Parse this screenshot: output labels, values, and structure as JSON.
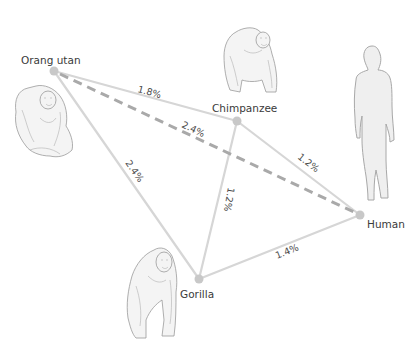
{
  "diagram": {
    "type": "genetic-distance-network",
    "nodes": [
      {
        "id": "orangutan",
        "label": "Orang utan",
        "illustration": "orangutan-icon"
      },
      {
        "id": "chimpanzee",
        "label": "Chimpanzee",
        "illustration": "chimpanzee-icon"
      },
      {
        "id": "human",
        "label": "Human",
        "illustration": "human-silhouette-icon"
      },
      {
        "id": "gorilla",
        "label": "Gorilla",
        "illustration": "gorilla-icon"
      }
    ],
    "edges": [
      {
        "from": "orangutan",
        "to": "chimpanzee",
        "label": "1.8%",
        "style": "solid"
      },
      {
        "from": "orangutan",
        "to": "human",
        "label": "2.4%",
        "style": "dashed"
      },
      {
        "from": "orangutan",
        "to": "gorilla",
        "label": "2.4%",
        "style": "solid"
      },
      {
        "from": "chimpanzee",
        "to": "human",
        "label": "1.2%",
        "style": "solid"
      },
      {
        "from": "chimpanzee",
        "to": "gorilla",
        "label": "1.2%",
        "style": "solid"
      },
      {
        "from": "gorilla",
        "to": "human",
        "label": "1.4%",
        "style": "solid"
      }
    ],
    "colors": {
      "edge": "#d6d6d6",
      "dashed_edge": "#a9a9a9",
      "node": "#c8c8c8",
      "text": "#3a3a3a"
    }
  }
}
